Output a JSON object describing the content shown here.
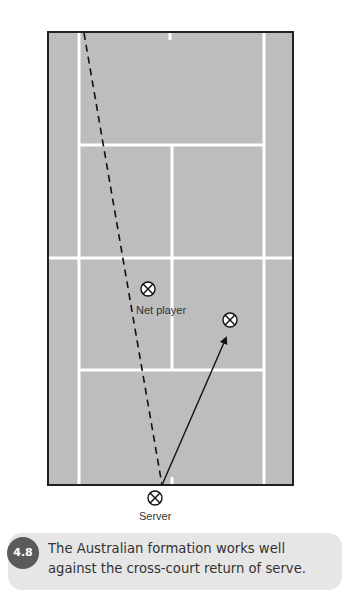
{
  "figure": {
    "court": {
      "surface_color": "#bdbdbd",
      "line_color": "#ffffff",
      "border_color": "#222222"
    },
    "players": [
      {
        "id": "net-player",
        "label": "Net player",
        "symbol": "circle-x-icon",
        "x": 148,
        "y": 289
      },
      {
        "id": "partner",
        "label": "",
        "symbol": "circle-x-icon",
        "x": 230,
        "y": 320
      },
      {
        "id": "server",
        "label": "Server",
        "symbol": "circle-x-icon",
        "x": 155,
        "y": 498
      }
    ],
    "paths": [
      {
        "id": "serve-path",
        "style": "dashed",
        "from": [
          84,
          32
        ],
        "to": [
          162,
          485
        ]
      },
      {
        "id": "movement-arrow",
        "style": "solid-arrow",
        "from": [
          162,
          485
        ],
        "to": [
          227,
          336
        ]
      }
    ],
    "labels": {
      "net_player": "Net player",
      "server": "Server"
    }
  },
  "caption": {
    "number": "4.8",
    "text": "The Australian formation works well against the cross-court return of serve.",
    "badge_color": "#5a5a5a",
    "box_color": "#e6e6e6"
  }
}
